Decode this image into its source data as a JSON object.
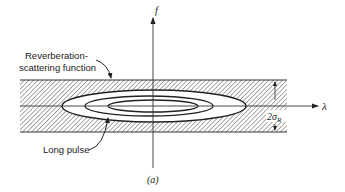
{
  "figure": {
    "caption": "(a)",
    "axes": {
      "x_label": "λ",
      "y_label": "f"
    },
    "annotations": {
      "reverberation_line1": "Reverberation-",
      "reverberation_line2": "scattering function",
      "long_pulse": "Long pulse",
      "band_width_main": "2σ",
      "band_width_sub": "R"
    },
    "elements": {
      "band": "hatched horizontal band (reverberation-scattering function)",
      "contours": [
        "outer ellipse",
        "middle ellipse",
        "inner ellipse"
      ]
    },
    "colors": {
      "line": "#222222",
      "hatch": "#555555",
      "background": "#ffffff"
    }
  }
}
